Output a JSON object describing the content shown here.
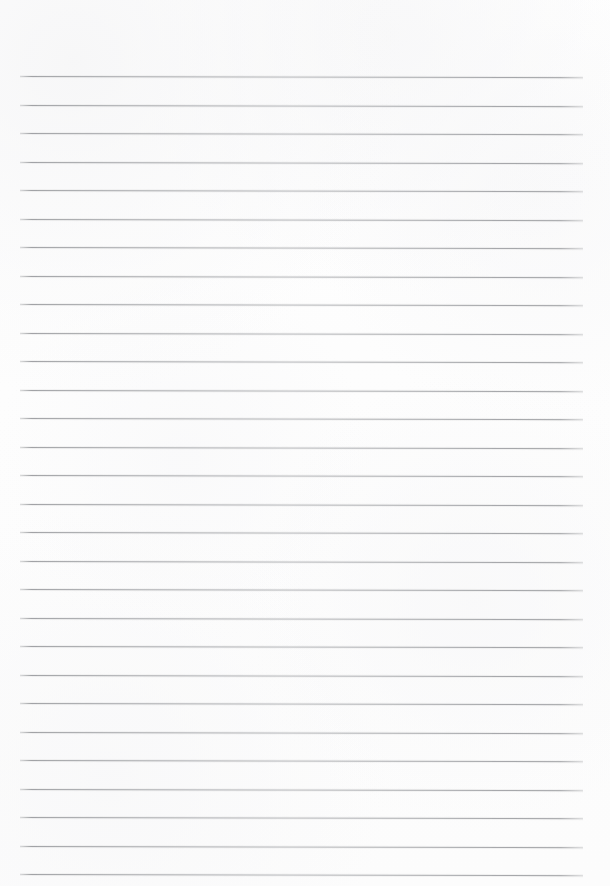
{
  "page": {
    "kind": "lined-paper-scan",
    "width_px": 610,
    "height_px": 886,
    "background_color": "#fdfdfd",
    "paper_tint": "#ffffff",
    "has_text_content": false,
    "has_margin_rule": false,
    "has_header": false,
    "has_page_number": false,
    "text_content": ""
  },
  "ruling": {
    "line_color": "#a9abaf",
    "line_color_core": "#96989c",
    "line_thickness_px": 1,
    "line_count": 29,
    "line_spacing_px": 28.5,
    "first_line_y_px": 76,
    "last_line_y_px": 874,
    "line_start_x_px": 20,
    "line_end_x_px": 583,
    "line_length_px": 563,
    "left_margin_px": 20,
    "right_margin_px": 27,
    "top_margin_px": 76,
    "slant_deg": 0.12,
    "lines": [
      {
        "index": 1,
        "y": 76,
        "content": ""
      },
      {
        "index": 2,
        "y": 104.5,
        "content": ""
      },
      {
        "index": 3,
        "y": 133,
        "content": ""
      },
      {
        "index": 4,
        "y": 161.5,
        "content": ""
      },
      {
        "index": 5,
        "y": 190,
        "content": ""
      },
      {
        "index": 6,
        "y": 218.5,
        "content": ""
      },
      {
        "index": 7,
        "y": 247,
        "content": ""
      },
      {
        "index": 8,
        "y": 275.5,
        "content": ""
      },
      {
        "index": 9,
        "y": 304,
        "content": ""
      },
      {
        "index": 10,
        "y": 332.5,
        "content": ""
      },
      {
        "index": 11,
        "y": 361,
        "content": ""
      },
      {
        "index": 12,
        "y": 389.5,
        "content": ""
      },
      {
        "index": 13,
        "y": 418,
        "content": ""
      },
      {
        "index": 14,
        "y": 446.5,
        "content": ""
      },
      {
        "index": 15,
        "y": 475,
        "content": ""
      },
      {
        "index": 16,
        "y": 503.5,
        "content": ""
      },
      {
        "index": 17,
        "y": 532,
        "content": ""
      },
      {
        "index": 18,
        "y": 560.5,
        "content": ""
      },
      {
        "index": 19,
        "y": 589,
        "content": ""
      },
      {
        "index": 20,
        "y": 617.5,
        "content": ""
      },
      {
        "index": 21,
        "y": 646,
        "content": ""
      },
      {
        "index": 22,
        "y": 674.5,
        "content": ""
      },
      {
        "index": 23,
        "y": 703,
        "content": ""
      },
      {
        "index": 24,
        "y": 731.5,
        "content": ""
      },
      {
        "index": 25,
        "y": 760,
        "content": ""
      },
      {
        "index": 26,
        "y": 788.5,
        "content": ""
      },
      {
        "index": 27,
        "y": 817,
        "content": ""
      },
      {
        "index": 28,
        "y": 845.5,
        "content": ""
      },
      {
        "index": 29,
        "y": 874,
        "content": ""
      }
    ]
  }
}
